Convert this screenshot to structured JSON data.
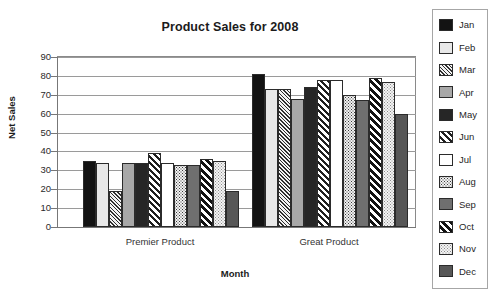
{
  "chart_data": {
    "type": "bar",
    "title": "Product Sales for 2008",
    "xlabel": "Month",
    "ylabel": "Net Sales",
    "categories": [
      "Premier Product",
      "Great Product"
    ],
    "ylim": [
      0,
      90
    ],
    "yticks": [
      0,
      10,
      20,
      30,
      40,
      50,
      60,
      70,
      80,
      90
    ],
    "grid": true,
    "legend_position": "right",
    "series": [
      {
        "name": "Jan",
        "pattern": "solid-black",
        "color": "#131313",
        "values": [
          35,
          81
        ]
      },
      {
        "name": "Feb",
        "pattern": "solid-light",
        "color": "#e8e8e8",
        "values": [
          34,
          73
        ]
      },
      {
        "name": "Mar",
        "pattern": "dense-diagonal",
        "color": "#2e2e2e",
        "values": [
          19,
          73
        ]
      },
      {
        "name": "Apr",
        "pattern": "solid-gray",
        "color": "#a8a8a8",
        "values": [
          34,
          68
        ]
      },
      {
        "name": "May",
        "pattern": "solid-dark",
        "color": "#262626",
        "values": [
          34,
          74
        ]
      },
      {
        "name": "Jun",
        "pattern": "wide-diagonal",
        "color": "#1f1f1f",
        "values": [
          39,
          78
        ]
      },
      {
        "name": "Jul",
        "pattern": "solid-white",
        "color": "#ffffff",
        "values": [
          34,
          78
        ]
      },
      {
        "name": "Aug",
        "pattern": "dotted-dark",
        "color": "#3a3a3a",
        "values": [
          33,
          70
        ]
      },
      {
        "name": "Sep",
        "pattern": "solid-mid-gray",
        "color": "#6f6f6f",
        "values": [
          33,
          67
        ]
      },
      {
        "name": "Oct",
        "pattern": "bold-diagonal",
        "color": "#121212",
        "values": [
          36,
          79
        ]
      },
      {
        "name": "Nov",
        "pattern": "dotted-light",
        "color": "#8d8d8d",
        "values": [
          35,
          77
        ]
      },
      {
        "name": "Dec",
        "pattern": "solid-dark-gray",
        "color": "#575757",
        "values": [
          19,
          60
        ]
      }
    ]
  },
  "legend": {
    "items": [
      {
        "label": "Jan"
      },
      {
        "label": "Feb"
      },
      {
        "label": "Mar"
      },
      {
        "label": "Apr"
      },
      {
        "label": "May"
      },
      {
        "label": "Jun"
      },
      {
        "label": "Jul"
      },
      {
        "label": "Aug"
      },
      {
        "label": "Sep"
      },
      {
        "label": "Oct"
      },
      {
        "label": "Nov"
      },
      {
        "label": "Dec"
      }
    ]
  }
}
